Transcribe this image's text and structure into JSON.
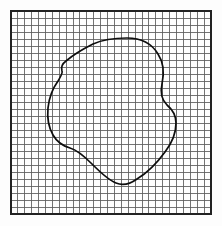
{
  "figure": {
    "name": "grid-with-irregular-region",
    "background_color": "#fdfdfd",
    "width": 222,
    "height": 226
  },
  "grid": {
    "name": "square-grid",
    "x": 11,
    "y": 11,
    "width": 200,
    "height": 203,
    "columns": 29,
    "rows": 29,
    "cell_size": 6.9,
    "minor_line_color": "#5b5b5b",
    "minor_line_width": 0.85,
    "border_color": "#222222",
    "border_width": 1.9
  },
  "chart_data": {
    "type": "scatter",
    "title": "",
    "xlabel": "",
    "ylabel": "",
    "grid": true,
    "legend": "none",
    "xlim": [
      11,
      211
    ],
    "ylim": [
      11,
      214
    ],
    "shapes": [
      {
        "name": "irregular-closed-region",
        "kind": "closed-curve",
        "closed": true,
        "stroke": "#0d0d0d",
        "stroke_width": 1.7,
        "fill": "none",
        "extremes": {
          "top": [
            127,
            38
          ],
          "right": [
            176,
            112
          ],
          "bottom": [
            126,
            184
          ],
          "left": [
            48,
            105
          ]
        },
        "path": "M 127 38 C 141 38 152 44 158 54 C 164 63 164 75 162 84 C 160 93 162 100 167 105 C 173 110 176 116 176 123 C 176 133 172 143 165 152 C 157 163 147 173 137 179 C 130 184 123 186 116 183 C 108 180 100 172 92 164 C 84 156 77 150 70 148 C 63 146 57 142 53 135 C 49 128 47 118 48 108 C 49 98 53 88 58 81 C 61 76 63 73 62 71 C 61 68 62 64 66 61 C 73 55 83 49 93 44 C 104 39 117 38 127 38 Z"
      }
    ],
    "points": []
  }
}
